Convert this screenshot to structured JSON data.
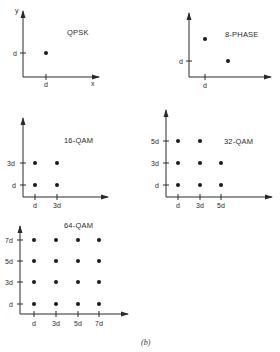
{
  "figure": {
    "caption": "(b)",
    "panels": [
      {
        "id": "qpsk",
        "title": "QPSK",
        "axis_labels": {
          "x": "x",
          "y": "y"
        },
        "x_ticks": [
          "d"
        ],
        "y_ticks": [
          "d"
        ],
        "points": [
          [
            1,
            1
          ]
        ]
      },
      {
        "id": "8-phase",
        "title": "8-PHASE",
        "x_ticks": [
          "d"
        ],
        "y_ticks": [
          "d"
        ],
        "points": [
          [
            1,
            2.2
          ],
          [
            2,
            1.2
          ]
        ]
      },
      {
        "id": "16-qam",
        "title": "16-QAM",
        "x_ticks": [
          "d",
          "3d"
        ],
        "y_ticks": [
          "d",
          "3d"
        ],
        "points": [
          [
            1,
            1
          ],
          [
            3,
            1
          ],
          [
            1,
            3
          ],
          [
            3,
            3
          ]
        ]
      },
      {
        "id": "32-qam",
        "title": "32-QAM",
        "x_ticks": [
          "d",
          "3d",
          "5d"
        ],
        "y_ticks": [
          "d",
          "3d",
          "5d"
        ],
        "points": [
          [
            1,
            1
          ],
          [
            3,
            1
          ],
          [
            5,
            1
          ],
          [
            1,
            3
          ],
          [
            3,
            3
          ],
          [
            5,
            3
          ],
          [
            1,
            5
          ],
          [
            3,
            5
          ]
        ]
      },
      {
        "id": "64-qam",
        "title": "64-QAM",
        "x_ticks": [
          "d",
          "3d",
          "5d",
          "7d"
        ],
        "y_ticks": [
          "d",
          "3d",
          "5d",
          "7d"
        ],
        "points": [
          [
            1,
            1
          ],
          [
            3,
            1
          ],
          [
            5,
            1
          ],
          [
            7,
            1
          ],
          [
            1,
            3
          ],
          [
            3,
            3
          ],
          [
            5,
            3
          ],
          [
            7,
            3
          ],
          [
            1,
            5
          ],
          [
            3,
            5
          ],
          [
            5,
            5
          ],
          [
            7,
            5
          ],
          [
            1,
            7
          ],
          [
            3,
            7
          ],
          [
            5,
            7
          ],
          [
            7,
            7
          ]
        ]
      }
    ]
  }
}
